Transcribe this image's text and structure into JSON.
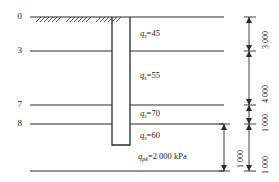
{
  "figure": {
    "type": "geotechnical-pile-section",
    "units_note": "mm"
  },
  "depth_markers": [
    {
      "label": "0",
      "y": 17
    },
    {
      "label": "3",
      "y": 51
    },
    {
      "label": "7",
      "y": 105
    },
    {
      "label": "8",
      "y": 124
    }
  ],
  "soil_layers": [
    {
      "label_prefix": "q",
      "subscript": "s",
      "equals": "=",
      "value": "45"
    },
    {
      "label_prefix": "q",
      "subscript": "s",
      "equals": "=",
      "value": "55"
    },
    {
      "label_prefix": "q",
      "subscript": "s",
      "equals": "=",
      "value": "70"
    },
    {
      "label_prefix": "q",
      "subscript": "s",
      "equals": "=",
      "value": "60"
    }
  ],
  "labels": {
    "qs_45": "q",
    "qs_45_sub": "s",
    "qs_45_val": "=45",
    "qs_55": "q",
    "qs_55_sub": "s",
    "qs_55_val": "=55",
    "qs_70": "q",
    "qs_70_sub": "s",
    "qs_70_val": "=70",
    "qs_60": "q",
    "qs_60_sub": "s",
    "qs_60_val": "=60",
    "qpk": "q",
    "qpk_sub": "pk",
    "qpk_val": "=2 000 kPa"
  },
  "dimensions": [
    {
      "name": "dim-3000",
      "text": "3 000"
    },
    {
      "name": "dim-4000",
      "text": "4 000"
    },
    {
      "name": "dim-1000-upper",
      "text": "1 000"
    },
    {
      "name": "dim-1000-inner",
      "text": "1 000"
    },
    {
      "name": "dim-1000-lower",
      "text": "1 000"
    }
  ],
  "colors": {
    "line": "#2b2b2b",
    "text": "#1a1a1a",
    "background": "#ffffff"
  }
}
